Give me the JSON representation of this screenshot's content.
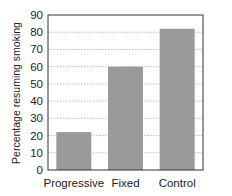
{
  "chart_data": {
    "type": "bar",
    "title": "",
    "xlabel": "",
    "ylabel": "Percentage resuming smoking",
    "categories": [
      "Progressive",
      "Fixed",
      "Control"
    ],
    "values": [
      22,
      60,
      82
    ],
    "ylim": [
      0,
      90
    ],
    "yticks": [
      0,
      10,
      20,
      30,
      40,
      50,
      60,
      70,
      80,
      90
    ],
    "grid": true,
    "legend": "none",
    "colors": {
      "bar": "#9a9a9a",
      "axis": "#333333",
      "grid": "#aaaaaa"
    }
  }
}
